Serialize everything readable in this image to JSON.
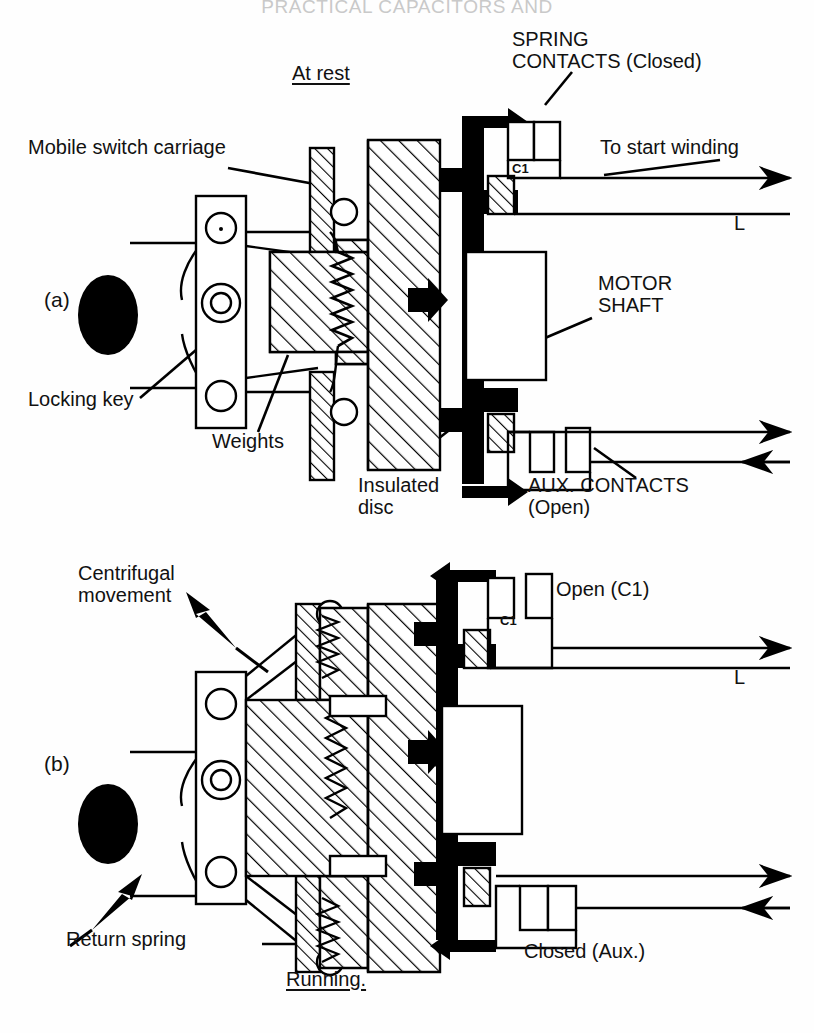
{
  "page": {
    "running_header": "PRACTICAL CAPACITORS AND",
    "background": "#fefefe",
    "ink": "#000000"
  },
  "figure": {
    "title_a": "At rest",
    "title_b": "Running.",
    "panel_a_label": "(a)",
    "panel_b_label": "(b)"
  },
  "panel_a": {
    "state_label": "At rest",
    "index_label": "(a)",
    "callouts": [
      {
        "name": "spring-contacts",
        "text": "SPRING\nCONTACTS (Closed)"
      },
      {
        "name": "to-start-winding",
        "text": "To start winding"
      },
      {
        "name": "line-terminal",
        "text": "L"
      },
      {
        "name": "contact-c1",
        "text": "C1"
      },
      {
        "name": "mobile-switch-carriage",
        "text": "Mobile switch carriage"
      },
      {
        "name": "motor-shaft",
        "text": "MOTOR\nSHAFT"
      },
      {
        "name": "locking-key",
        "text": "Locking key"
      },
      {
        "name": "weights",
        "text": "Weights"
      },
      {
        "name": "insulated-disc",
        "text": "Insulated\ndisc"
      },
      {
        "name": "aux-contacts",
        "text": "AUX. CONTACTS\n(Open)"
      }
    ],
    "contact_states": {
      "spring_c1": "Closed",
      "aux": "Open"
    },
    "motion_arrow": "right"
  },
  "panel_b": {
    "state_label": "Running.",
    "index_label": "(b)",
    "callouts": [
      {
        "name": "centrifugal-movement",
        "text": "Centrifugal\nmovement"
      },
      {
        "name": "open-c1",
        "text": "Open (C1)"
      },
      {
        "name": "contact-c1",
        "text": "C1"
      },
      {
        "name": "line-terminal",
        "text": "L"
      },
      {
        "name": "return-spring",
        "text": "Return spring"
      },
      {
        "name": "closed-aux",
        "text": "Closed (Aux.)"
      }
    ],
    "contact_states": {
      "spring_c1": "Open",
      "aux": "Closed"
    },
    "motion_arrow": "left"
  }
}
